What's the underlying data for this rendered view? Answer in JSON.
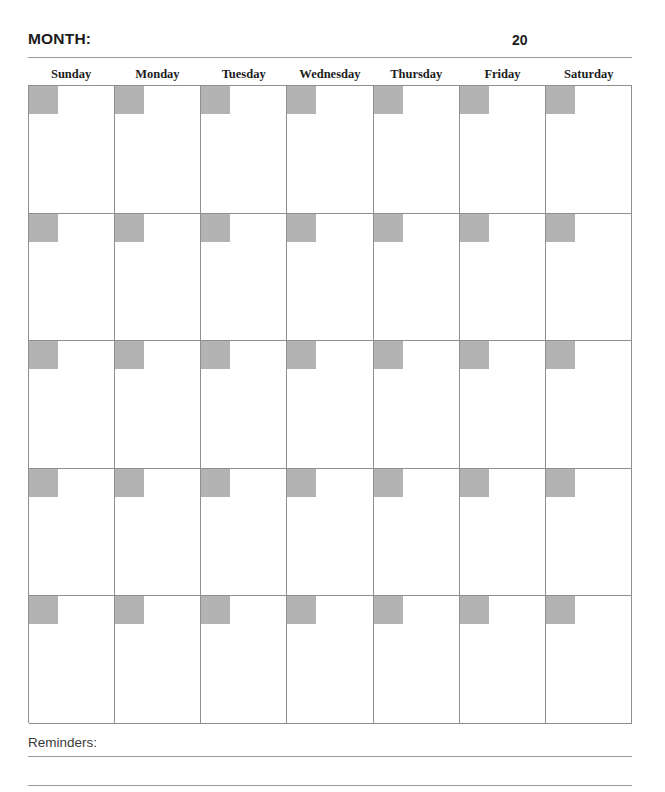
{
  "header": {
    "month_label": "MONTH:",
    "year_prefix": "20"
  },
  "weekdays": [
    {
      "label": "Sunday"
    },
    {
      "label": "Monday"
    },
    {
      "label": "Tuesday"
    },
    {
      "label": "Wednesday"
    },
    {
      "label": "Thursday"
    },
    {
      "label": "Friday"
    },
    {
      "label": "Saturday"
    }
  ],
  "grid": {
    "rows": 5,
    "columns": 7,
    "cells_blank": true
  },
  "footer": {
    "reminders_label": "Reminders:",
    "rule_count": 2
  },
  "colors": {
    "date_box_fill": "#b3b3b3",
    "grid_line": "#8f8f8f",
    "rule_line": "#9a9a9a",
    "heading_text": "#1b1b1b",
    "body_text": "#3a3a3a",
    "page_background": "#ffffff"
  }
}
